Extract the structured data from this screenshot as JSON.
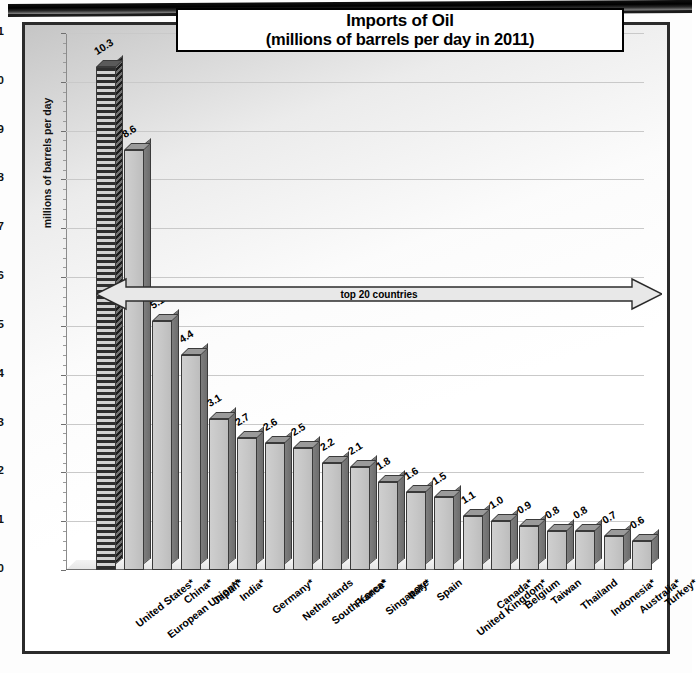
{
  "chart_data": {
    "type": "bar",
    "title": "Imports of Oil",
    "subtitle": "(millions of barrels per day in 2011)",
    "xlabel": "",
    "ylabel": "millions of barrels per day",
    "ylim": [
      0,
      11
    ],
    "yticks": [
      0,
      1,
      2,
      3,
      4,
      5,
      6,
      7,
      8,
      9,
      10,
      11
    ],
    "grid": true,
    "legend": "none",
    "annotation": "top 20 countries",
    "categories": [
      "United States*",
      "European Union**",
      "China*",
      "Japan*",
      "India*",
      "Germany*",
      "Netherlands",
      "South Korea*",
      "France*",
      "Singapore",
      "Italy*",
      "Spain",
      "United Kingdom*",
      "Canada*",
      "Belgium",
      "Taiwan",
      "Thailand",
      "Indonesia*",
      "Australia*",
      "Turkey*"
    ],
    "values": [
      10.3,
      8.6,
      5.1,
      4.4,
      3.1,
      2.7,
      2.6,
      2.5,
      2.2,
      2.1,
      1.8,
      1.6,
      1.5,
      1.1,
      1.0,
      0.9,
      0.8,
      0.8,
      0.7,
      0.6
    ],
    "value_labels": [
      "10.3",
      "8.6",
      "5.1",
      "4.4",
      "3.1",
      "2.7",
      "2.6",
      "2.5",
      "2.2",
      "2.1",
      "1.8",
      "1.6",
      "1.5",
      "1.1",
      "1.0",
      "0.9",
      "0.8",
      "0.8",
      "0.7",
      "0.6"
    ],
    "highlighted_index": 0,
    "colors": {
      "bar_face": "#c6c6c6",
      "bar_side": "#6d6d6d",
      "bar_outline": "#3a3a3a",
      "highlight_pattern": "#2e2e2e",
      "gridline": "#c9c9c9",
      "frame": "#2b2b2b",
      "text": "#000000"
    }
  }
}
